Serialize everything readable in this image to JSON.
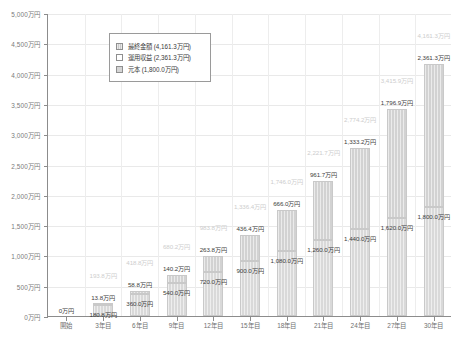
{
  "chart_data": {
    "type": "bar",
    "title": "",
    "xlabel": "",
    "ylabel": "",
    "ylim": [
      0,
      5000
    ],
    "ytick_step": 500,
    "grid": true,
    "stacked": true,
    "legend_position": "top-left",
    "categories": [
      "開始",
      "3年目",
      "6年目",
      "9年目",
      "12年目",
      "15年目",
      "18年目",
      "21年目",
      "24年目",
      "27年目",
      "30年目"
    ],
    "ytick_labels": [
      "0万円",
      "500万円",
      "1,000万円",
      "1,500万円",
      "2,000万円",
      "2,500万円",
      "3,000万円",
      "3,500万円",
      "4,000万円",
      "4,500万円",
      "5,000万円"
    ],
    "ytick_values": [
      0,
      500,
      1000,
      1500,
      2000,
      2500,
      3000,
      3500,
      4000,
      4500,
      5000
    ],
    "series": [
      {
        "name": "元本",
        "values": [
          0.0,
          180.8,
          360.0,
          540.0,
          720.0,
          900.0,
          1080.0,
          1260.0,
          1440.0,
          1620.0,
          1800.0
        ],
        "labels": [
          "0万円",
          "180.8万円",
          "360.0万円",
          "540.0万円",
          "720.0万円",
          "900.0万円",
          "1,080.0万円",
          "1,260.0万円",
          "1,440.0万円",
          "1,620.0万円",
          "1,800.0万円"
        ]
      },
      {
        "name": "運用収益",
        "values": [
          0.0,
          13.8,
          58.8,
          140.2,
          263.8,
          436.4,
          666.0,
          961.7,
          1333.2,
          1796.9,
          2361.3
        ],
        "labels": [
          "",
          "13.8万円",
          "58.8万円",
          "140.2万円",
          "263.8万円",
          "436.4万円",
          "666.0万円",
          "961.7万円",
          "1,333.2万円",
          "1,796.9万円",
          "2,361.3万円"
        ]
      }
    ],
    "totals": {
      "name": "最終金額",
      "values": [
        0.0,
        193.8,
        418.8,
        680.2,
        983.8,
        1336.4,
        1746.0,
        2221.7,
        2774.2,
        3415.9,
        4161.3
      ],
      "labels": [
        "0万円",
        "193.8万円",
        "418.8万円",
        "680.2万円",
        "983.8万円",
        "1,336.4万円",
        "1,746.0万円",
        "2,221.7万円",
        "2,774.2万円",
        "3,415.9万円",
        "4,161.3万円"
      ]
    },
    "legend": [
      {
        "key": "total",
        "label": "最終金額 (4,161.3万円)"
      },
      {
        "key": "profit",
        "label": "運用収益 (2,361.3万円)"
      },
      {
        "key": "principal",
        "label": "元本 (1,800.0万円)"
      }
    ],
    "colors": {
      "bar": "#d5d5d5",
      "bar_border": "#c9c9c9",
      "axis": "#8c8c8c",
      "grid": "#e9e9e9",
      "label": "#3d3d3d",
      "total_label": "#cdcdcd",
      "tick_label": "#7a7a7a"
    }
  }
}
